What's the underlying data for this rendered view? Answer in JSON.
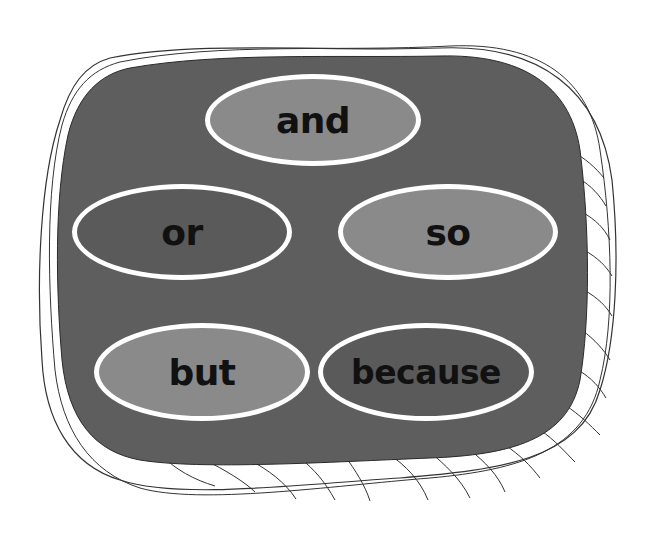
{
  "diagram": {
    "title": "",
    "container": {
      "fill": "#5e5e5e",
      "outline": "#2a2a2a",
      "shadow_fill": "#ffffff"
    },
    "ovals": [
      {
        "label": "and",
        "fill": "#8a8a8a",
        "border": "#ffffff"
      },
      {
        "label": "or",
        "fill": "#5a5a5a",
        "border": "#ffffff"
      },
      {
        "label": "so",
        "fill": "#8a8a8a",
        "border": "#ffffff"
      },
      {
        "label": "but",
        "fill": "#8a8a8a",
        "border": "#ffffff"
      },
      {
        "label": "because",
        "fill": "#5a5a5a",
        "border": "#ffffff"
      }
    ]
  }
}
